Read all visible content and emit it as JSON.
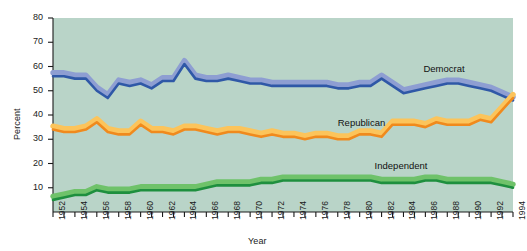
{
  "chart_data": {
    "type": "line",
    "title": "",
    "xlabel": "Year",
    "ylabel": "Percent",
    "ylim": [
      0,
      80
    ],
    "xlim": [
      1952,
      1994
    ],
    "yticks": [
      10,
      20,
      30,
      40,
      50,
      60,
      70,
      80
    ],
    "xticks": [
      1952,
      1954,
      1956,
      1958,
      1960,
      1962,
      1964,
      1966,
      1968,
      1970,
      1972,
      1974,
      1976,
      1978,
      1980,
      1982,
      1984,
      1986,
      1988,
      1990,
      1992,
      1994
    ],
    "grid": false,
    "legend_position": "inline-annotations",
    "background_color": "#b9d4c8",
    "x": [
      1952,
      1953,
      1954,
      1955,
      1956,
      1957,
      1958,
      1959,
      1960,
      1961,
      1962,
      1963,
      1964,
      1965,
      1966,
      1967,
      1968,
      1969,
      1970,
      1971,
      1972,
      1973,
      1974,
      1975,
      1976,
      1977,
      1978,
      1979,
      1980,
      1981,
      1982,
      1983,
      1984,
      1985,
      1986,
      1987,
      1988,
      1989,
      1990,
      1991,
      1992,
      1993,
      1994
    ],
    "series": [
      {
        "name": "Democrat",
        "color": "#2f58a7",
        "band_color": "#8e9ed2",
        "values": [
          56,
          56,
          55,
          55,
          50,
          47,
          53,
          52,
          53,
          51,
          54,
          54,
          61,
          55,
          54,
          54,
          55,
          54,
          53,
          53,
          52,
          52,
          52,
          52,
          52,
          52,
          51,
          51,
          52,
          52,
          55,
          52,
          49,
          50,
          51,
          52,
          53,
          53,
          52,
          51,
          50,
          48,
          46
        ]
      },
      {
        "name": "Republican",
        "color": "#f08a1d",
        "band_color": "#fcc45b",
        "values": [
          34,
          33,
          33,
          34,
          37,
          33,
          32,
          32,
          36,
          33,
          33,
          32,
          34,
          34,
          33,
          32,
          33,
          33,
          32,
          31,
          32,
          31,
          31,
          30,
          31,
          31,
          30,
          30,
          32,
          32,
          31,
          36,
          36,
          36,
          35,
          37,
          36,
          36,
          36,
          38,
          37,
          42,
          47
        ]
      },
      {
        "name": "Independent",
        "color": "#1e8f3e",
        "band_color": "#6fc26a",
        "values": [
          5,
          6,
          7,
          7,
          9,
          8,
          8,
          8,
          9,
          9,
          9,
          9,
          9,
          9,
          10,
          11,
          11,
          11,
          11,
          12,
          12,
          13,
          13,
          13,
          13,
          13,
          13,
          13,
          13,
          13,
          12,
          12,
          12,
          12,
          13,
          13,
          12,
          12,
          12,
          12,
          12,
          11,
          10
        ]
      }
    ]
  },
  "axes": {
    "ylabel": "Percent",
    "xlabel": "Year"
  },
  "annotations": {
    "democrat": "Democrat",
    "republican": "Republican",
    "independent": "Independent"
  }
}
